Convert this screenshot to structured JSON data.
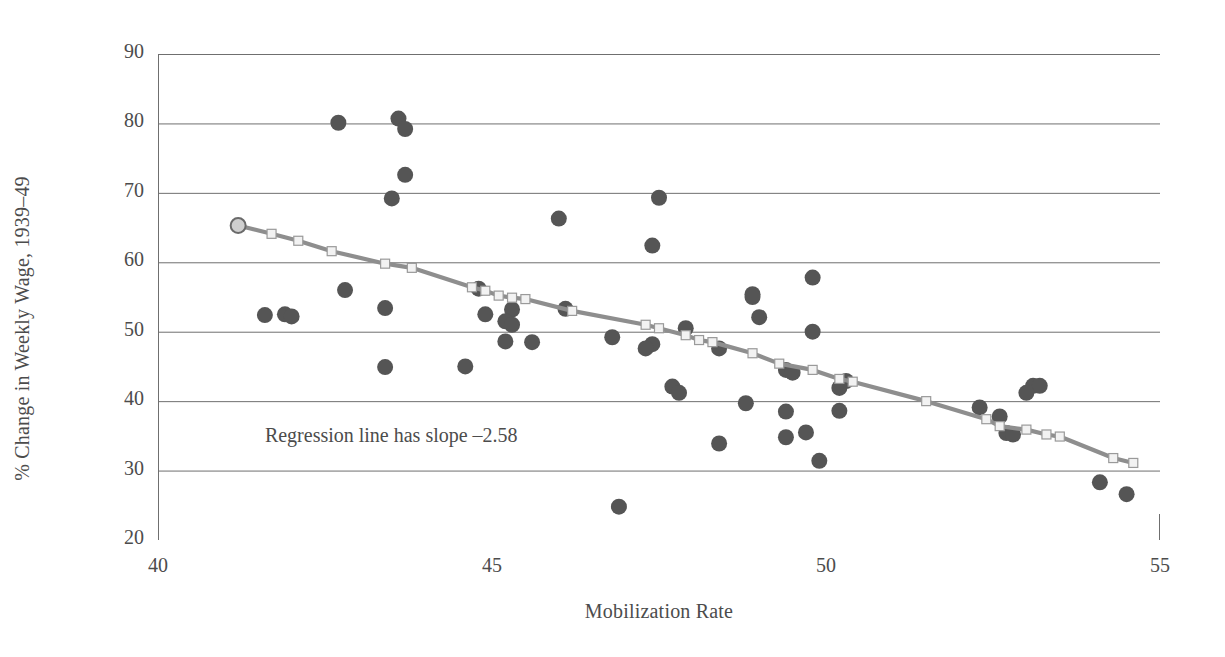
{
  "chart_data": {
    "type": "scatter",
    "title": "",
    "xlabel": "Mobilization Rate",
    "ylabel": "% Change in Weekly Wage, 1939–49",
    "xlim": [
      40,
      55
    ],
    "ylim": [
      20,
      90
    ],
    "xticks": [
      40,
      45,
      50,
      55
    ],
    "yticks": [
      20,
      30,
      40,
      50,
      60,
      70,
      80,
      90
    ],
    "grid": "horizontal",
    "legend": "none",
    "annotations": [
      {
        "text": "Regression line has slope –2.58",
        "x": 41.6,
        "y": 34.7
      }
    ],
    "series": [
      {
        "name": "states",
        "type": "scatter",
        "marker": "filled-circle",
        "color": "#555555",
        "points": [
          [
            42.7,
            80.1
          ],
          [
            43.6,
            80.7
          ],
          [
            43.7,
            79.2
          ],
          [
            43.7,
            72.6
          ],
          [
            43.5,
            69.2
          ],
          [
            47.5,
            69.3
          ],
          [
            46.0,
            66.3
          ],
          [
            47.4,
            62.4
          ],
          [
            49.8,
            57.8
          ],
          [
            42.8,
            56.0
          ],
          [
            44.8,
            56.2
          ],
          [
            48.9,
            55.4
          ],
          [
            48.9,
            55.0
          ],
          [
            45.3,
            53.2
          ],
          [
            46.1,
            53.3
          ],
          [
            43.4,
            53.4
          ],
          [
            44.9,
            52.5
          ],
          [
            49.0,
            52.1
          ],
          [
            41.6,
            52.4
          ],
          [
            41.9,
            52.5
          ],
          [
            42.0,
            52.2
          ],
          [
            45.2,
            51.5
          ],
          [
            45.3,
            51.0
          ],
          [
            47.9,
            50.5
          ],
          [
            49.8,
            50.0
          ],
          [
            46.8,
            49.2
          ],
          [
            45.2,
            48.6
          ],
          [
            45.6,
            48.5
          ],
          [
            47.4,
            48.2
          ],
          [
            47.3,
            47.6
          ],
          [
            48.4,
            47.6
          ],
          [
            44.6,
            45.0
          ],
          [
            43.4,
            44.9
          ],
          [
            49.4,
            44.5
          ],
          [
            49.5,
            44.1
          ],
          [
            50.3,
            42.9
          ],
          [
            50.2,
            41.9
          ],
          [
            47.7,
            42.1
          ],
          [
            47.8,
            41.2
          ],
          [
            53.1,
            42.2
          ],
          [
            53.2,
            42.2
          ],
          [
            53.0,
            41.2
          ],
          [
            52.3,
            39.1
          ],
          [
            48.8,
            39.7
          ],
          [
            50.2,
            38.6
          ],
          [
            49.4,
            38.5
          ],
          [
            52.6,
            37.8
          ],
          [
            52.7,
            35.4
          ],
          [
            52.8,
            35.2
          ],
          [
            49.7,
            35.5
          ],
          [
            49.4,
            34.8
          ],
          [
            48.4,
            33.9
          ],
          [
            49.9,
            31.4
          ],
          [
            54.1,
            28.3
          ],
          [
            54.5,
            26.6
          ],
          [
            46.9,
            24.8
          ]
        ]
      },
      {
        "name": "regression-line",
        "type": "line",
        "marker": "open-square",
        "color": "#8e8e8e",
        "slope": -2.58,
        "points": [
          [
            41.2,
            65.3
          ],
          [
            41.7,
            64.1
          ],
          [
            42.1,
            63.1
          ],
          [
            42.6,
            61.6
          ],
          [
            43.4,
            59.8
          ],
          [
            43.8,
            59.2
          ],
          [
            44.7,
            56.4
          ],
          [
            44.9,
            55.9
          ],
          [
            45.1,
            55.2
          ],
          [
            45.3,
            54.9
          ],
          [
            45.5,
            54.7
          ],
          [
            46.2,
            53.0
          ],
          [
            47.3,
            51.0
          ],
          [
            47.5,
            50.5
          ],
          [
            47.9,
            49.5
          ],
          [
            48.1,
            48.8
          ],
          [
            48.3,
            48.5
          ],
          [
            48.9,
            46.9
          ],
          [
            49.3,
            45.4
          ],
          [
            49.8,
            44.5
          ],
          [
            50.2,
            43.2
          ],
          [
            50.4,
            42.8
          ],
          [
            51.5,
            40.0
          ],
          [
            52.4,
            37.4
          ],
          [
            52.6,
            36.4
          ],
          [
            53.0,
            35.9
          ],
          [
            53.3,
            35.2
          ],
          [
            53.5,
            34.9
          ],
          [
            54.3,
            31.8
          ],
          [
            54.6,
            31.1
          ]
        ]
      }
    ]
  },
  "axis": {
    "y_tick_labels": [
      "90",
      "80",
      "70",
      "60",
      "50",
      "40",
      "30",
      "20"
    ],
    "x_tick_labels": [
      "40",
      "45",
      "50",
      "55"
    ]
  }
}
